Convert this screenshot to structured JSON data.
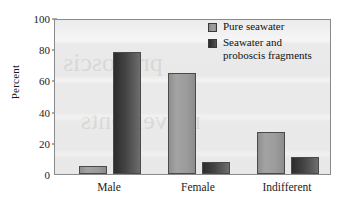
{
  "chart_data": {
    "type": "bar",
    "title": "",
    "xlabel": "",
    "ylabel": "Percent",
    "ylim": [
      0,
      100
    ],
    "yticks": [
      0,
      20,
      40,
      60,
      80,
      100
    ],
    "ytick_labels": [
      "0",
      "20",
      "40",
      "60",
      "80",
      "100"
    ],
    "grid": false,
    "legend_position": "top-right",
    "categories": [
      "Male",
      "Female",
      "Indifferent"
    ],
    "series": [
      {
        "name": "Pure seawater",
        "color": "#9b9b9b",
        "values": [
          5,
          65,
          27
        ]
      },
      {
        "name": "Seawater and\nproboscis fragments",
        "color": "#3d3d3d",
        "values": [
          78,
          8,
          11
        ]
      }
    ]
  },
  "legend": {
    "entries": [
      {
        "label": "Pure seawater",
        "swatch": "light-gray-swatch"
      },
      {
        "label": "Seawater and\nproboscis fragments",
        "swatch": "dark-gray-swatch"
      }
    ]
  },
  "axes": {
    "y_title": "Percent",
    "y_tick_labels": [
      "100",
      "80",
      "60",
      "40",
      "20",
      "0"
    ],
    "x_tick_labels": [
      "Male",
      "Female",
      "Indifferent"
    ]
  },
  "ghost": {
    "line1": "proboscis",
    "line2": "movements"
  },
  "colors": {
    "plot_background": "#eaeaea",
    "axis_line": "#8a8a8a",
    "bar_light": "#9b9b9b",
    "bar_dark": "#3d3d3d",
    "text": "#111111"
  }
}
